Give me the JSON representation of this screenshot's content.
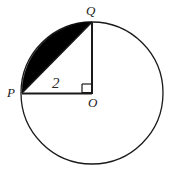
{
  "figure": {
    "type": "geometry-diagram",
    "width": 169,
    "height": 181,
    "background_color": "#ffffff",
    "stroke_color": "#1a1a1a",
    "shade_color": "#000000",
    "circle": {
      "name": "circle-O",
      "center_x": 92,
      "center_y": 93,
      "radius": 71,
      "stroke_width": 1.3
    },
    "points": [
      {
        "id": "P",
        "label": "P",
        "x": 22,
        "y": 93
      },
      {
        "id": "Q",
        "label": "Q",
        "x": 92,
        "y": 22
      },
      {
        "id": "O",
        "label": "O",
        "x": 92,
        "y": 93
      }
    ],
    "segments": [
      {
        "id": "PO",
        "label": "2",
        "from": "P",
        "to": "O",
        "stroke_width": 2
      },
      {
        "id": "QO",
        "label": "",
        "from": "Q",
        "to": "O",
        "stroke_width": 2
      },
      {
        "id": "PQ",
        "label": "",
        "from": "P",
        "to": "Q",
        "stroke_width": 1.5
      }
    ],
    "right_angle": {
      "at": "O",
      "size": 9,
      "marker": "square"
    },
    "shaded_region": {
      "name": "circular-segment-PQ",
      "path": "M 22 93 A 71 71 0 0 1 92 22 L 22 93 Z",
      "fill": "#000000"
    },
    "labels": {
      "p": "P",
      "q": "Q",
      "o": "O",
      "radius": "2"
    }
  }
}
